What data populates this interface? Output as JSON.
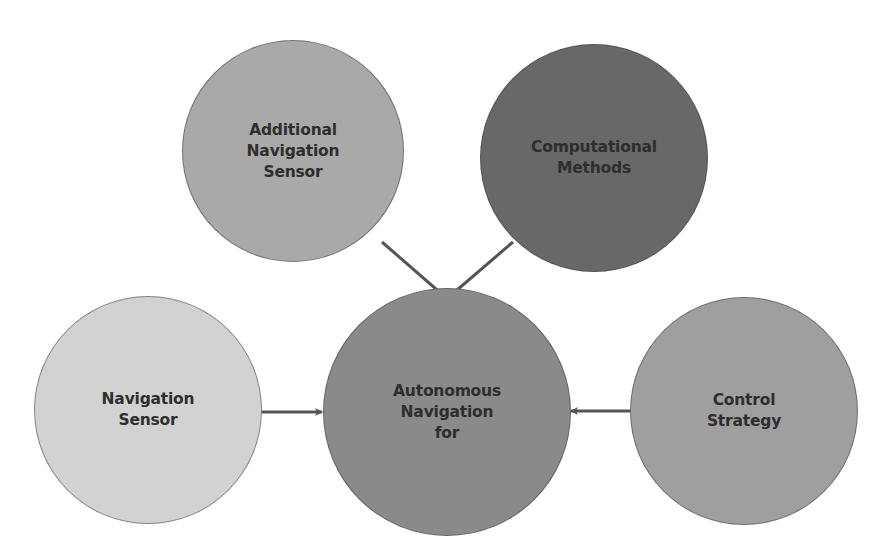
{
  "diagram": {
    "type": "concept-map",
    "colors": {
      "background": "#ffffff",
      "arrow": "#555555",
      "text": "#2e2e2e"
    },
    "nodes": [
      {
        "id": "additional-navigation-sensor",
        "label": "Additional\nNavigation\nSensor",
        "cx": 293,
        "cy": 151,
        "r": 111,
        "fill": "#a9a9a9"
      },
      {
        "id": "computational-methods",
        "label": "Computational\nMethods",
        "cx": 594,
        "cy": 158,
        "r": 114,
        "fill": "#686868"
      },
      {
        "id": "autonomous-navigation",
        "label": "Autonomous\nNavigation\nfor",
        "cx": 447,
        "cy": 412,
        "r": 124,
        "fill": "#8a8a8a"
      },
      {
        "id": "navigation-sensor",
        "label": "Navigation\nSensor",
        "cx": 148,
        "cy": 410,
        "r": 114,
        "fill": "#d2d2d2"
      },
      {
        "id": "control-strategy",
        "label": "Control\nStrategy",
        "cx": 744,
        "cy": 411,
        "r": 114,
        "fill": "#9f9f9f"
      }
    ],
    "edges": [
      {
        "from": "additional-navigation-sensor",
        "to": "autonomous-navigation",
        "x1": 382,
        "y1": 242,
        "x2": 444,
        "y2": 296
      },
      {
        "from": "computational-methods",
        "to": "autonomous-navigation",
        "x1": 513,
        "y1": 242,
        "x2": 450,
        "y2": 296
      },
      {
        "from": "navigation-sensor",
        "to": "autonomous-navigation",
        "x1": 261,
        "y1": 412,
        "x2": 322,
        "y2": 412
      },
      {
        "from": "control-strategy",
        "to": "autonomous-navigation",
        "x1": 631,
        "y1": 411,
        "x2": 571,
        "y2": 411
      }
    ]
  }
}
